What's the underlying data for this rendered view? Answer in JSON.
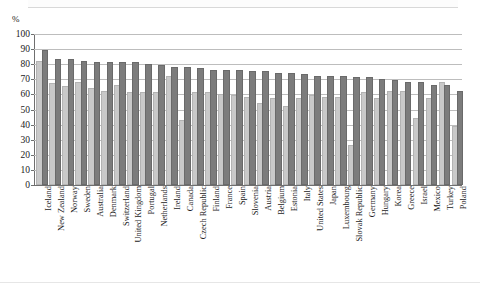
{
  "figure": {
    "unit_label": "%",
    "top_cropped_text": "",
    "bar_color_light": "#c9c9c9",
    "bar_color_dark": "#7c7c7c",
    "gridline_color": "#bdbdbd",
    "axis_color": "#6f6f6f"
  },
  "chart_data": {
    "type": "bar",
    "title": "",
    "subtitle": "",
    "xlabel": "",
    "ylabel": "%",
    "ylim": [
      0,
      100
    ],
    "yticks": [
      0,
      10,
      20,
      30,
      40,
      50,
      60,
      70,
      80,
      90,
      100
    ],
    "grid": true,
    "legend_position": "none",
    "legend": [],
    "orientation": "vertical",
    "grouping": "grouped",
    "categories": [
      "Iceland",
      "New Zealand",
      "Norway",
      "Sweden",
      "Australia",
      "Denmark",
      "Switzerland",
      "United Kingdom",
      "Portugal",
      "Netherlands",
      "Ireland",
      "Canada",
      "Czech Republic",
      "Finland",
      "France",
      "Spain",
      "Slovenia",
      "Austria",
      "Belgium",
      "Estonia",
      "Italy",
      "United States",
      "Japan",
      "Luxembourg",
      "Slovak Republic",
      "Germany",
      "Hungary",
      "Korea",
      "Greece",
      "Israel",
      "Mexico",
      "Turkey",
      "Poland"
    ],
    "series": [
      {
        "name": "Series 1",
        "color": "#c9c9c9",
        "values": [
          81,
          66,
          64,
          67,
          63,
          61,
          65,
          60,
          60,
          60,
          71,
          42,
          60,
          60,
          59,
          58,
          57,
          53,
          56,
          51,
          56,
          58,
          57,
          57,
          25,
          60,
          56,
          61,
          61,
          43,
          56,
          67,
          38
        ]
      },
      {
        "name": "Series 2",
        "color": "#7c7c7c",
        "values": [
          88,
          82,
          82,
          81,
          80,
          80,
          80,
          80,
          79,
          78,
          77,
          77,
          76,
          75,
          75,
          75,
          74,
          74,
          73,
          73,
          72,
          71,
          71,
          71,
          70,
          70,
          69,
          68,
          67,
          67,
          65,
          65,
          61
        ]
      }
    ]
  }
}
